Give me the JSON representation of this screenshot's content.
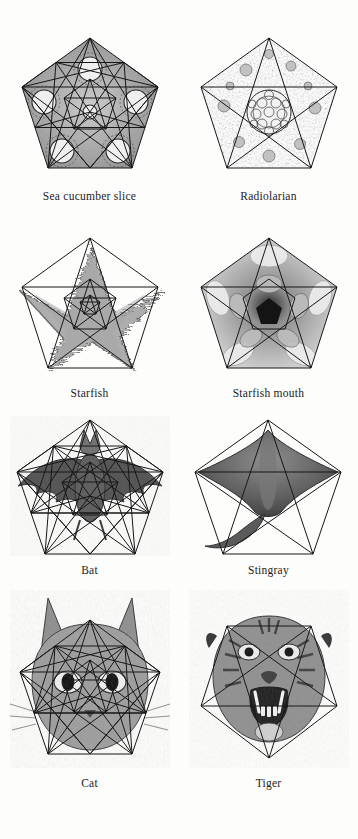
{
  "plate": {
    "background_color": "#fdfdfc",
    "ink_color": "#171717",
    "layout": "4 rows x 2 columns",
    "theme": "Pentagonal and pentagram symmetry in nature"
  },
  "figures": [
    {
      "id": "sea-cucumber-slice",
      "caption": "Sea cucumber slice",
      "row": 1,
      "column": 1,
      "geometry": "pentagon with dense nested pentagram lattice",
      "orientation": "point-up",
      "specimen_tone": "#6f6f6f"
    },
    {
      "id": "radiolarian",
      "caption": "Radiolarian",
      "row": 1,
      "column": 2,
      "geometry": "pentagon with inscribed pentagram",
      "orientation": "point-up",
      "specimen_tone": "#7a7a7a"
    },
    {
      "id": "starfish",
      "caption": "Starfish",
      "row": 2,
      "column": 1,
      "geometry": "pentagon with pentagram and inner nested pentagram",
      "orientation": "point-up",
      "specimen_tone": "#6b6b6b"
    },
    {
      "id": "starfish-mouth",
      "caption": "Starfish mouth",
      "row": 2,
      "column": 2,
      "geometry": "pentagon with pentagram and inner pentagon",
      "orientation": "point-up",
      "specimen_tone": "#8a8a8a"
    },
    {
      "id": "bat",
      "caption": "Bat",
      "row": 3,
      "column": 1,
      "geometry": "pentagon with dense nested pentagram lattice",
      "orientation": "point-up",
      "specimen_tone": "#555555"
    },
    {
      "id": "stingray",
      "caption": "Stingray",
      "row": 3,
      "column": 2,
      "geometry": "pentagon with inscribed pentagram",
      "orientation": "point-up",
      "specimen_tone": "#636363"
    },
    {
      "id": "cat",
      "caption": "Cat",
      "row": 4,
      "column": 1,
      "geometry": "pentagon with dense nested pentagram lattice",
      "orientation": "point-up",
      "specimen_tone": "#5e5e5e"
    },
    {
      "id": "tiger",
      "caption": "Tiger",
      "row": 4,
      "column": 2,
      "geometry": "inverted pentagon with inscribed inverted pentagram",
      "orientation": "point-down",
      "specimen_tone": "#5a5a5a"
    }
  ]
}
